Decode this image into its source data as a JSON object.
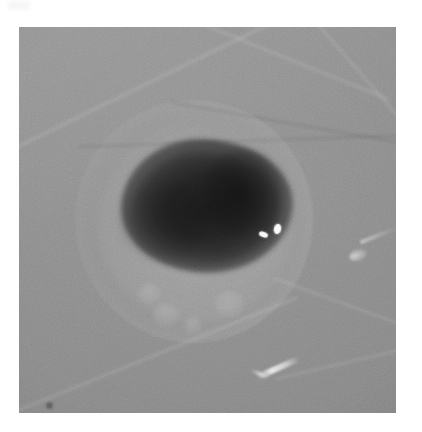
{
  "figure": {
    "caption": "",
    "panel_label": "",
    "scale_bar_label": "",
    "annotations": []
  },
  "photo": {
    "x": 19,
    "y": 27,
    "width": 377,
    "height": 386,
    "modality": "grayscale-photomicrograph",
    "page_background_color": "#ffffff",
    "background_tone_color": "#8e8e8e",
    "highlight_color": "#f5f5f5",
    "shadow_color": "#3a3a3a"
  },
  "subject": {
    "name": "specimen-sphere",
    "description": "large translucent spherical specimen with bright membrane rim",
    "center_x": 225,
    "center_y": 222,
    "radius": 120,
    "membrane_highlight_side": "right",
    "shadow_side": "left"
  },
  "inner_mass": {
    "name": "embryo-mass",
    "description": "dark irregular mass occupying the upper-central region",
    "x": 121,
    "y": 139,
    "width": 172,
    "height": 134
  },
  "features": [
    {
      "name": "eye-speck-left",
      "kind": "bright-speck",
      "x": 240,
      "y": 205
    },
    {
      "name": "eye-speck-right",
      "kind": "bright-speck",
      "x": 255,
      "y": 197
    },
    {
      "name": "vesicle-1",
      "kind": "faint-vesicle",
      "x": 153,
      "y": 303
    },
    {
      "name": "vesicle-2",
      "kind": "faint-vesicle",
      "x": 184,
      "y": 317
    },
    {
      "name": "vesicle-3",
      "kind": "faint-vesicle",
      "x": 215,
      "y": 291
    },
    {
      "name": "vesicle-4",
      "kind": "faint-vesicle",
      "x": 139,
      "y": 283
    },
    {
      "name": "bottom-filament",
      "kind": "bright-filament",
      "x": 259,
      "y": 341
    },
    {
      "name": "right-protrusion",
      "kind": "membrane-protrusion",
      "x": 339,
      "y": 228
    },
    {
      "name": "dark-fleck",
      "kind": "emulsion-artifact",
      "x": 30,
      "y": 378
    }
  ],
  "creases": [
    {
      "name": "crease-upper-left",
      "tone": "light"
    },
    {
      "name": "crease-upper-mid",
      "tone": "light"
    },
    {
      "name": "crease-upper-right",
      "tone": "light"
    },
    {
      "name": "crease-lower-left",
      "tone": "light"
    },
    {
      "name": "crease-lower-right",
      "tone": "light"
    },
    {
      "name": "crease-bottom-right",
      "tone": "light"
    },
    {
      "name": "crease-mid-dark",
      "tone": "dark"
    },
    {
      "name": "crease-upper-dark",
      "tone": "dark"
    }
  ]
}
